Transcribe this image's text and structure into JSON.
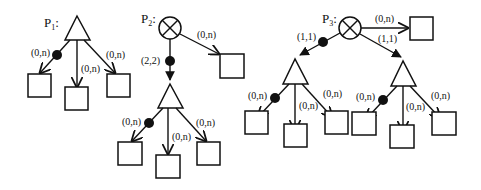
{
  "diagrams": [
    {
      "id": "P1",
      "label": "P",
      "subscript": "1",
      "root": "triangle",
      "edges": [
        {
          "label": "(0,n)",
          "target": "box",
          "mandatory_dot": true
        },
        {
          "label": "(0,n)",
          "target": "box",
          "mandatory_dot": false
        },
        {
          "label": "(0,n)",
          "target": "box",
          "mandatory_dot": false
        }
      ]
    },
    {
      "id": "P2",
      "label": "P",
      "subscript": "2",
      "root": "circle-x",
      "edges": [
        {
          "label": "(2,2)",
          "target": "triangle",
          "mandatory_dot": true
        },
        {
          "label": "(0,n)",
          "target": "box",
          "mandatory_dot": false
        }
      ],
      "sub_triangle_edges": [
        {
          "label": "(0,n)",
          "target": "box",
          "mandatory_dot": true
        },
        {
          "label": "(0,n)",
          "target": "box",
          "mandatory_dot": false
        },
        {
          "label": "(0,n)",
          "target": "box",
          "mandatory_dot": false
        }
      ]
    },
    {
      "id": "P3",
      "label": "P",
      "subscript": "3",
      "root": "circle-x",
      "edges": [
        {
          "label": "(1,1)",
          "target": "triangle",
          "mandatory_dot": true
        },
        {
          "label": "(0,n)",
          "target": "box",
          "mandatory_dot": false
        },
        {
          "label": "(1,1)",
          "target": "triangle",
          "mandatory_dot": false
        }
      ],
      "left_triangle_edges": [
        {
          "label": "(0,n)",
          "target": "box",
          "mandatory_dot": true
        },
        {
          "label": "(0,n)",
          "target": "box",
          "mandatory_dot": false
        },
        {
          "label": "(0,n)",
          "target": "box",
          "mandatory_dot": false
        }
      ],
      "right_triangle_edges": [
        {
          "label": "(0,n)",
          "target": "box",
          "mandatory_dot": true
        },
        {
          "label": "(0,n)",
          "target": "box",
          "mandatory_dot": false
        },
        {
          "label": "(0,n)",
          "target": "box",
          "mandatory_dot": false
        }
      ]
    }
  ]
}
